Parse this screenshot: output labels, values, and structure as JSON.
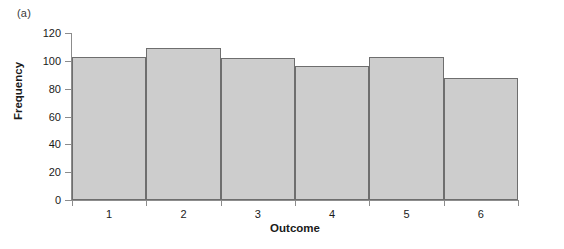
{
  "panel": {
    "label": "(a)"
  },
  "chart_data": {
    "type": "bar",
    "title": "",
    "subtitle": "",
    "xlabel": "Outcome",
    "ylabel": "Frequency",
    "categories": [
      "1",
      "2",
      "3",
      "4",
      "5",
      "6"
    ],
    "values": [
      103,
      109,
      102,
      96,
      103,
      88
    ],
    "series": [
      {
        "name": "Frequency",
        "values": [
          103,
          109,
          102,
          96,
          103,
          88
        ]
      }
    ],
    "ylim": [
      0,
      120
    ],
    "yticks": [
      0,
      20,
      40,
      60,
      80,
      100,
      120
    ],
    "ytick_labels": [
      "0",
      "20",
      "40",
      "60",
      "80",
      "100",
      "120"
    ],
    "xtick_labels": [
      "1",
      "2",
      "3",
      "4",
      "5",
      "6"
    ],
    "grid": false,
    "legend": false,
    "legend_position": "none",
    "bar_fill_color": "#cdcdcd",
    "bar_edge_color": "#6e6e6e",
    "axis_color": "#8c8c8c",
    "text_color": "#1a1a1a",
    "background_color": "#ffffff"
  }
}
